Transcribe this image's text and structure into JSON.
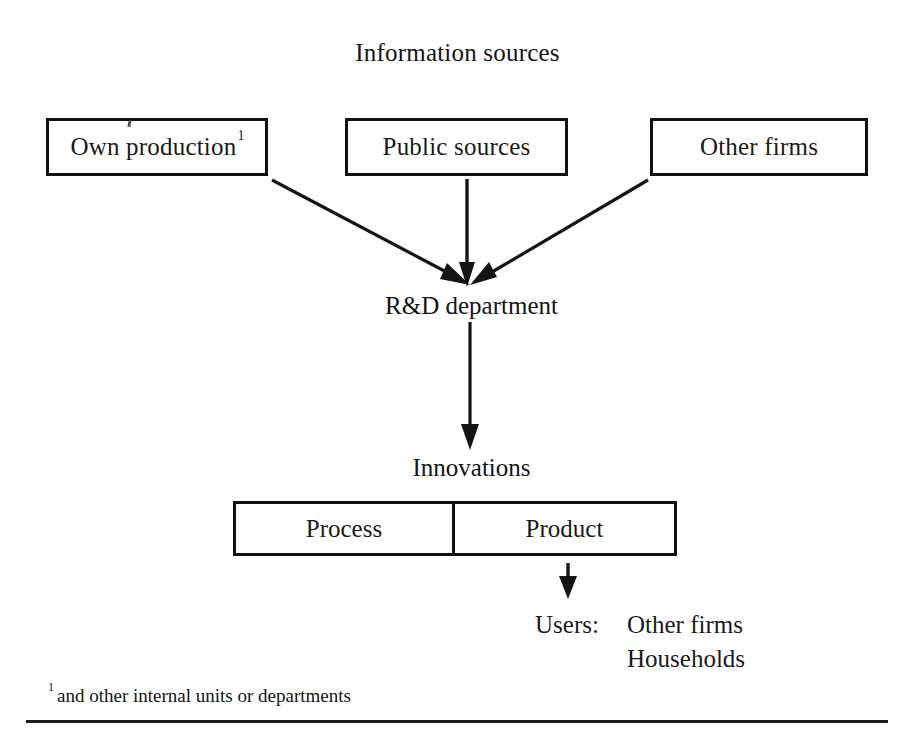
{
  "diagram": {
    "title": "Information sources",
    "type": "flow-diagram",
    "source_boxes": [
      {
        "id": "own-production",
        "label": "Own production",
        "footnote_marker": "1"
      },
      {
        "id": "public-sources",
        "label": "Public sources",
        "footnote_marker": ""
      },
      {
        "id": "other-firms",
        "label": "Other firms",
        "footnote_marker": ""
      }
    ],
    "rnd_label": "R&D department",
    "innovations_label": "Innovations",
    "innovation_types": [
      {
        "id": "process",
        "label": "Process"
      },
      {
        "id": "product",
        "label": "Product"
      }
    ],
    "users": {
      "label": "Users:",
      "items": [
        "Other firms",
        "Households"
      ]
    },
    "footnote": {
      "marker": "1",
      "text": "and other internal units or departments"
    },
    "colors": {
      "ink": "#141414",
      "stroke": "#111111",
      "background": "#ffffff"
    }
  }
}
